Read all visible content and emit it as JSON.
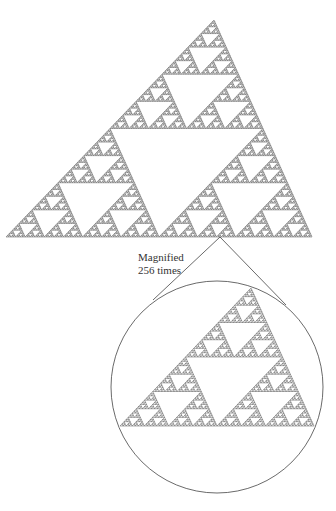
{
  "figure": {
    "stroke_color": "#444444",
    "background": "#ffffff",
    "big_triangle": {
      "apex": [
        214,
        20
      ],
      "left": [
        6,
        237
      ],
      "right": [
        312,
        237
      ],
      "depth": 7
    },
    "zoom_origin": [
      220,
      237
    ],
    "zoom_lines": [
      {
        "from": [
          220,
          237
        ],
        "to": [
          153,
          300
        ]
      },
      {
        "from": [
          220,
          237
        ],
        "to": [
          286,
          305
        ]
      }
    ],
    "circle": {
      "cx": 217,
      "cy": 387,
      "r": 106
    },
    "small_triangle": {
      "apex": [
        251,
        288
      ],
      "left": [
        120,
        426
      ],
      "right": [
        314,
        426
      ],
      "depth": 6
    },
    "annotation": {
      "line1": "Magnified",
      "line2": "256 times",
      "x": 138,
      "y": 251
    }
  }
}
